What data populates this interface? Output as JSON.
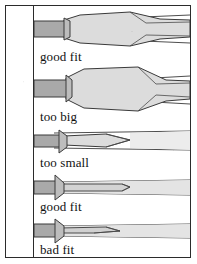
{
  "figure": {
    "frame": {
      "border_color": "#2b2b2b",
      "background": "#ffffff"
    },
    "palette": {
      "outline": "#3a3a3a",
      "shaft_fill": "#a9a9a9",
      "blade_fill": "#d9d9d9",
      "slot_fill": "#e8e8e8",
      "text": "#111111",
      "paper": "#ffffff"
    },
    "rows": [
      {
        "index": 1,
        "caption": "good fit",
        "fit": "good",
        "shaft": "wide",
        "blade": "broad-wedge",
        "slot": "matched"
      },
      {
        "index": 2,
        "caption": "too big",
        "fit": "too-big",
        "shaft": "wide",
        "blade": "oversize-wedge",
        "slot": "overfilled"
      },
      {
        "index": 3,
        "caption": "too small",
        "fit": "too-small",
        "shaft": "medium",
        "blade": "narrow-taper",
        "slot": "underfilled"
      },
      {
        "index": 4,
        "caption": "good fit",
        "fit": "good",
        "shaft": "narrow",
        "blade": "thin-parallel",
        "slot": "matched"
      },
      {
        "index": 5,
        "caption": "bad fit",
        "fit": "bad",
        "shaft": "narrow",
        "blade": "thin-tapered-point",
        "slot": "mismatched"
      }
    ]
  }
}
